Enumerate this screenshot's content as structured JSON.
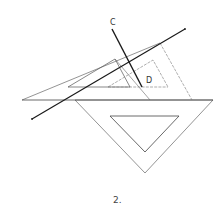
{
  "figure": {
    "caption": "2.",
    "labels": {
      "line_c": "C",
      "point_d": "D"
    },
    "colors": {
      "stroke": "#555555",
      "heavy": "#1a1a1a",
      "background": "#ffffff"
    },
    "elements": [
      "upper set square (30-60) with inner cutout",
      "dashed displaced set square outline",
      "lower inverted set square with inner cutout",
      "long heavy line",
      "heavy line C"
    ]
  }
}
